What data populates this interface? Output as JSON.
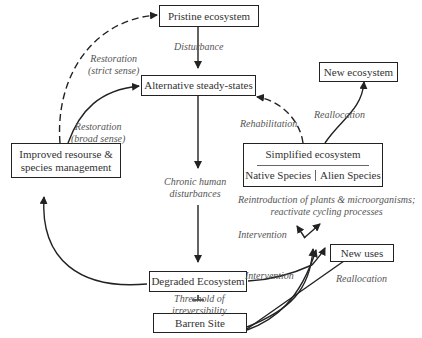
{
  "nodes": {
    "pristine": "Pristine ecosystem",
    "alternative": "Alternative steady-states",
    "new_ecosystem": "New ecosystem",
    "improved_line1": "Improved resourse &",
    "improved_line2": "species management",
    "simplified": "Simplified ecosystem",
    "native": "Native Species",
    "alien": "Alien Species",
    "degraded": "Degraded Ecosystem",
    "new_uses": "New uses",
    "barren": "Barren Site"
  },
  "labels": {
    "disturbance": "Disturbance",
    "restoration_strict_1": "Restoration",
    "restoration_strict_2": "(strict sense)",
    "restoration_broad_1": "Restoration",
    "restoration_broad_2": "(broad sense)",
    "rehabilitation": "Rehabilitation",
    "reallocation_top": "Reallocation",
    "chronic_1": "Chronic human",
    "chronic_2": "disturbances",
    "reintro_1": "Reintroduction of plants & microorganisms;",
    "reintro_2": "reactivate cycling processes",
    "intervention_1": "Intervention",
    "intervention_2": "Intervention",
    "threshold_1": "Threshold of",
    "threshold_2": "irreversibility",
    "reallocation_bottom": "Reallocation"
  },
  "colors": {
    "line": "#222222",
    "text": "#333333",
    "label": "#555555"
  }
}
